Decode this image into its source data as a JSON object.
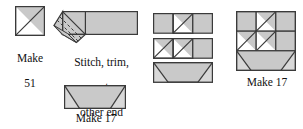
{
  "diagram": {
    "kind": "quilting-piecing-instructions",
    "fabric_fill": "#c9c9c9",
    "background_fill": "#ffffff",
    "line_color": "#3a3a3a",
    "text_color": "#111111"
  },
  "steps": [
    {
      "id": "hst-unit",
      "name": "half-square-triangle-unit",
      "caption": "Make\n51",
      "caption_line1": "Make",
      "caption_line2": "51",
      "quantity": 51,
      "shape": "square-with-diagonal",
      "shaded_half": "upper-right"
    },
    {
      "id": "stitch-trim",
      "name": "stitch-trim-rectangle",
      "caption": "Stitch, trim,\nrepeat on\nother end",
      "caption_line1": "Stitch, trim,",
      "caption_line2": "repeat on",
      "caption_line3": "other end",
      "quantity": null,
      "shape": "rectangle-with-corner-square-and-stitch-lines",
      "stitch_line_style": "dashed-diagonal"
    },
    {
      "id": "flying-geese",
      "name": "flying-geese-unit",
      "caption": "Make 17",
      "quantity": 17,
      "shape": "rectangle-with-two-corner-triangles",
      "corner_triangles": [
        "bottom-left",
        "bottom-right"
      ]
    },
    {
      "id": "assembled-block",
      "name": "assembled-tree-block",
      "caption": "Make 17",
      "quantity": 17,
      "shape": "three-by-three-pieced-block"
    }
  ],
  "assembly_rows": [
    {
      "id": "row-1",
      "name": "assembly-row-top",
      "cells": [
        "plain",
        "diagonal-up",
        "plain"
      ]
    },
    {
      "id": "row-2",
      "name": "assembly-row-middle",
      "cells": [
        "diagonal-up",
        "diagonal-up",
        "plain"
      ]
    },
    {
      "id": "row-3",
      "name": "assembly-row-bottom",
      "cells": [
        "flying-geese"
      ]
    }
  ]
}
